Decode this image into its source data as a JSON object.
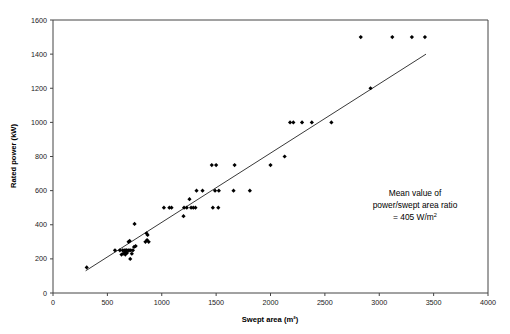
{
  "chart_data": {
    "type": "scatter",
    "title": "",
    "xlabel": "Swept area (m²)",
    "ylabel": "Rated power (kW)",
    "xlim": [
      0,
      4000
    ],
    "ylim": [
      0,
      1600
    ],
    "xticks": [
      0,
      500,
      1000,
      1500,
      2000,
      2500,
      3000,
      3500,
      4000
    ],
    "yticks": [
      0,
      200,
      400,
      600,
      800,
      1000,
      1200,
      1400,
      1600
    ],
    "xtick_labels": [
      "0",
      "500",
      "1000",
      "1500",
      "2000",
      "2500",
      "3000",
      "3500",
      "4000"
    ],
    "ytick_labels": [
      "0",
      "200",
      "400",
      "600",
      "800",
      "1000",
      "1200",
      "1400",
      "1600"
    ],
    "grid": false,
    "legend": null,
    "marker_color": "#000000",
    "marker_shape": "diamond",
    "series": [
      {
        "name": "Wind turbines",
        "points": [
          [
            310,
            150
          ],
          [
            570,
            250
          ],
          [
            615,
            250
          ],
          [
            630,
            225
          ],
          [
            640,
            250
          ],
          [
            645,
            230
          ],
          [
            655,
            250
          ],
          [
            660,
            240
          ],
          [
            665,
            225
          ],
          [
            670,
            250
          ],
          [
            675,
            250
          ],
          [
            680,
            235
          ],
          [
            690,
            250
          ],
          [
            695,
            300
          ],
          [
            700,
            250
          ],
          [
            705,
            305
          ],
          [
            710,
            200
          ],
          [
            715,
            250
          ],
          [
            725,
            230
          ],
          [
            735,
            250
          ],
          [
            745,
            270
          ],
          [
            750,
            405
          ],
          [
            760,
            275
          ],
          [
            850,
            300
          ],
          [
            860,
            350
          ],
          [
            865,
            310
          ],
          [
            870,
            340
          ],
          [
            880,
            300
          ],
          [
            1020,
            500
          ],
          [
            1070,
            500
          ],
          [
            1090,
            500
          ],
          [
            1200,
            450
          ],
          [
            1205,
            500
          ],
          [
            1230,
            500
          ],
          [
            1255,
            550
          ],
          [
            1270,
            500
          ],
          [
            1290,
            500
          ],
          [
            1310,
            500
          ],
          [
            1320,
            600
          ],
          [
            1375,
            600
          ],
          [
            1460,
            750
          ],
          [
            1470,
            500
          ],
          [
            1490,
            600
          ],
          [
            1500,
            750
          ],
          [
            1520,
            500
          ],
          [
            1525,
            600
          ],
          [
            1660,
            600
          ],
          [
            1670,
            750
          ],
          [
            1810,
            600
          ],
          [
            2000,
            750
          ],
          [
            2130,
            800
          ],
          [
            2180,
            1000
          ],
          [
            2210,
            1000
          ],
          [
            2290,
            1000
          ],
          [
            2380,
            1000
          ],
          [
            2560,
            1000
          ],
          [
            2830,
            1500
          ],
          [
            2920,
            1200
          ],
          [
            3120,
            1500
          ],
          [
            3300,
            1500
          ],
          [
            3420,
            1500
          ]
        ]
      }
    ],
    "trendline": {
      "x0": 300,
      "y0": 130,
      "x1": 3430,
      "y1": 1400
    },
    "annotations": [
      {
        "lines": [
          "Mean value of",
          "power/swept area ratio",
          "= 405 W/m²"
        ],
        "x": 2700,
        "y": 600
      }
    ]
  },
  "annotation": {
    "line1": "Mean value of",
    "line2": "power/swept area ratio",
    "line3_prefix": "= 405 W/m",
    "line3_sup": "2"
  },
  "axes": {
    "x_title": "Swept area (m²)",
    "y_title": "Rated power (kW)"
  }
}
